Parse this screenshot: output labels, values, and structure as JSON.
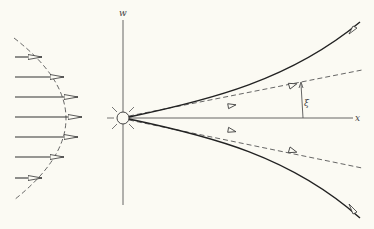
{
  "diagram": {
    "axis_labels": {
      "vertical": "w",
      "horizontal": "x",
      "angle": "ξ"
    },
    "colors": {
      "background": "#fbfaf3",
      "ink": "#333333",
      "thin": "#555555"
    },
    "source": {
      "center": [
        123,
        118
      ],
      "radius": 6
    },
    "inflow_arrows": [
      {
        "y": 57,
        "x_end": 42
      },
      {
        "y": 77,
        "x_end": 64
      },
      {
        "y": 97,
        "x_end": 78
      },
      {
        "y": 117,
        "x_end": 82
      },
      {
        "y": 137,
        "x_end": 78
      },
      {
        "y": 157,
        "x_end": 64
      },
      {
        "y": 178,
        "x_end": 42
      }
    ]
  }
}
